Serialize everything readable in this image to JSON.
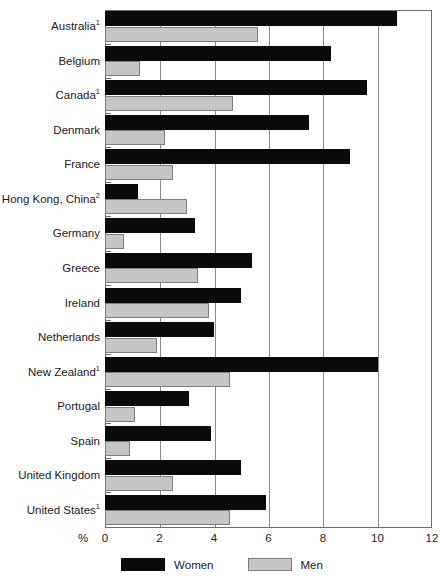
{
  "chart_data": {
    "type": "bar",
    "orientation": "horizontal",
    "title": "",
    "subtitle": "",
    "xlabel": "%",
    "ylabel": "",
    "xlim": [
      0,
      12
    ],
    "xticks": [
      0,
      2,
      4,
      6,
      8,
      10,
      12
    ],
    "xtick_labels": [
      "0",
      "2",
      "4",
      "6",
      "8",
      "10",
      "12"
    ],
    "grid": true,
    "grid_axis": "x",
    "legend_position": "bottom-center",
    "categories": [
      "Australia¹",
      "Belgium",
      "Canada¹",
      "Denmark",
      "France",
      "Hong Kong, China²",
      "Germany",
      "Greece",
      "Ireland",
      "Netherlands",
      "New Zealand¹",
      "Portugal",
      "Spain",
      "United Kingdom",
      "United States¹"
    ],
    "category_plain": [
      "Australia",
      "Belgium",
      "Canada",
      "Denmark",
      "France",
      "Hong Kong, China",
      "Germany",
      "Greece",
      "Ireland",
      "Netherlands",
      "New Zealand",
      "Portugal",
      "Spain",
      "United Kingdom",
      "United States"
    ],
    "category_footnotes": [
      "1",
      "",
      "1",
      "",
      "",
      "2",
      "",
      "",
      "",
      "",
      "1",
      "",
      "",
      "",
      "1"
    ],
    "series": [
      {
        "name": "Women",
        "color": "#0a0a0a",
        "values": [
          10.7,
          8.3,
          9.6,
          7.5,
          9.0,
          1.2,
          3.3,
          5.4,
          5.0,
          4.0,
          10.0,
          3.1,
          3.9,
          5.0,
          5.9
        ]
      },
      {
        "name": "Men",
        "color": "#c6c6c6",
        "values": [
          5.6,
          1.3,
          4.7,
          2.2,
          2.5,
          3.0,
          0.7,
          3.4,
          3.8,
          1.9,
          4.6,
          1.1,
          0.9,
          2.5,
          4.6
        ]
      }
    ]
  },
  "legend": {
    "items": [
      {
        "label": "Women",
        "swatch": "black-swatch"
      },
      {
        "label": "Men",
        "swatch": "gray-swatch"
      }
    ]
  },
  "axis": {
    "percent_symbol": "%"
  }
}
